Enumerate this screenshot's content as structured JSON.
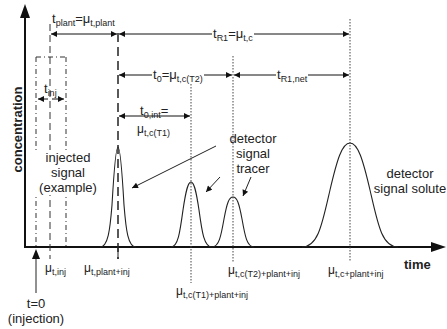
{
  "axes": {
    "y_label": "concentration",
    "x_label": "time"
  },
  "intervals": {
    "t_plant": {
      "name": "t",
      "sub": "plant",
      "eq": "=",
      "mu": "μ",
      "mu_sub": "t,plant"
    },
    "t_R1": {
      "name": "t",
      "sub": "R1",
      "eq": "=",
      "mu": "μ",
      "mu_sub": "t,c"
    },
    "t_0": {
      "name": "t",
      "sub": "0",
      "eq": "=",
      "mu": "μ",
      "mu_sub": "t,c(T2)"
    },
    "t_R1_net": {
      "name": "t",
      "sub": "R1,net"
    },
    "t_0_int": {
      "name": "t",
      "sub": "0,int",
      "eq": "=",
      "mu": "μ",
      "mu_sub": "t,c(T1)"
    },
    "t_inj": {
      "name": "t",
      "sub": "inj"
    }
  },
  "annotations": {
    "injected_signal": [
      "injected",
      "signal",
      "(example)"
    ],
    "detector_tracer": [
      "detector",
      "signal",
      "tracer"
    ],
    "detector_solute": [
      "detector",
      "signal solute"
    ],
    "injection_origin": [
      "t=0",
      "(injection)"
    ]
  },
  "tick_labels": {
    "mu_inj": {
      "mu": "μ",
      "sub": "t,inj"
    },
    "mu_plant_inj": {
      "mu": "μ",
      "sub": "t,plant+inj"
    },
    "mu_T1": {
      "mu": "μ",
      "sub": "t,c(T1)+plant+inj"
    },
    "mu_T2": {
      "mu": "μ",
      "sub": "t,c(T2)+plant+inj"
    },
    "mu_c": {
      "mu": "μ",
      "sub": "t,c+plant+inj"
    }
  },
  "peaks": [
    {
      "name": "plant-peak",
      "x": 118,
      "height": 100,
      "width": 6
    },
    {
      "name": "tracer-T1-peak",
      "x": 191,
      "height": 65,
      "width": 8
    },
    {
      "name": "tracer-T2-peak",
      "x": 233,
      "height": 50,
      "width": 8
    },
    {
      "name": "solute-peak",
      "x": 350,
      "height": 104,
      "width": 19
    }
  ]
}
